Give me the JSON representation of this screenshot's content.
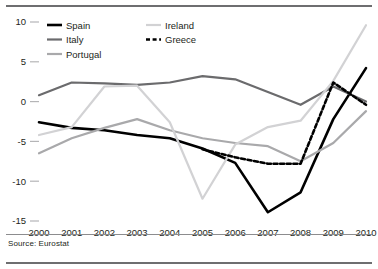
{
  "source_note": "Source: Eurostat",
  "legend": {
    "entries": [
      {
        "label": "Spain",
        "color": "#000000",
        "dash": "none",
        "width": 2.6,
        "col": 0,
        "row": 0
      },
      {
        "label": "Italy",
        "color": "#6b6b6d",
        "dash": "none",
        "width": 2.2,
        "col": 0,
        "row": 1
      },
      {
        "label": "Portugal",
        "color": "#a9a9ab",
        "dash": "none",
        "width": 2.2,
        "col": 0,
        "row": 2
      },
      {
        "label": "Ireland",
        "color": "#d2d2d4",
        "dash": "none",
        "width": 2.2,
        "col": 1,
        "row": 0
      },
      {
        "label": "Greece",
        "color": "#000000",
        "dash": "4,2.6",
        "width": 2.6,
        "col": 1,
        "row": 1
      }
    ]
  },
  "chart_data": {
    "type": "line",
    "title": "",
    "xlabel": "",
    "ylabel": "",
    "x": [
      2000,
      2001,
      2002,
      2003,
      2004,
      2005,
      2006,
      2007,
      2008,
      2009,
      2010
    ],
    "categories": [
      "2000",
      "2001",
      "2002",
      "2003",
      "2004",
      "2005",
      "2006",
      "2007",
      "2008",
      "2009",
      "2010"
    ],
    "ylim": [
      -15,
      10
    ],
    "xlim": [
      2000,
      2010
    ],
    "yticks": [
      10,
      5,
      0,
      -5,
      -10,
      -15
    ],
    "ytick_labels": [
      "10",
      "5",
      "0",
      "-5",
      "-10",
      "-15"
    ],
    "grid": false,
    "legend_position": "top-left",
    "series": [
      {
        "name": "Spain",
        "color": "#000000",
        "dash": "none",
        "width": 2.6,
        "values": [
          -2.6,
          -3.3,
          -3.6,
          -4.2,
          -4.6,
          -5.9,
          -7.7,
          -13.9,
          -11.4,
          -2.2,
          4.2
        ]
      },
      {
        "name": "Italy",
        "color": "#6b6b6d",
        "dash": "none",
        "width": 2.2,
        "values": [
          0.8,
          2.4,
          2.3,
          2.1,
          2.4,
          3.2,
          2.8,
          1.2,
          -0.4,
          1.9,
          0.0
        ]
      },
      {
        "name": "Portugal",
        "color": "#a9a9ab",
        "dash": "none",
        "width": 2.2,
        "values": [
          -6.5,
          -4.6,
          -3.3,
          -2.2,
          -3.6,
          -4.6,
          -5.2,
          -5.6,
          -7.5,
          -5.2,
          -1.2
        ]
      },
      {
        "name": "Ireland",
        "color": "#d2d2d4",
        "dash": "none",
        "width": 2.2,
        "values": [
          -4.2,
          -3.2,
          1.9,
          2.0,
          -2.6,
          -12.2,
          -5.4,
          -3.2,
          -2.4,
          2.6,
          9.6
        ]
      },
      {
        "name": "Greece",
        "color": "#000000",
        "dash": "4,2.6",
        "width": 2.6,
        "values": [
          null,
          null,
          null,
          null,
          null,
          -6.0,
          -7.0,
          -7.8,
          -7.8,
          2.4,
          -0.4
        ]
      }
    ]
  }
}
